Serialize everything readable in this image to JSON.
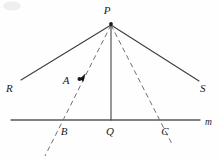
{
  "figure": {
    "labels": {
      "p": "P",
      "r": "R",
      "s": "S",
      "a": "A",
      "b": "B",
      "q": "Q",
      "c": "C",
      "m": "m"
    },
    "points": {
      "P": {
        "x": 111,
        "y": 23
      },
      "R": {
        "x": 21,
        "y": 80
      },
      "S": {
        "x": 199,
        "y": 81
      },
      "A": {
        "x": 79,
        "y": 79
      },
      "B": {
        "x": 62,
        "y": 120
      },
      "Q": {
        "x": 111,
        "y": 120
      },
      "C": {
        "x": 160,
        "y": 120
      }
    },
    "line_m": {
      "x1": 11,
      "y1": 120,
      "x2": 200,
      "y2": 120
    },
    "segments": [
      {
        "name": "P-R",
        "x1": 111,
        "y1": 25,
        "x2": 21,
        "y2": 80,
        "style": "solid"
      },
      {
        "name": "P-S",
        "x1": 111,
        "y1": 25,
        "x2": 199,
        "y2": 81,
        "style": "solid"
      },
      {
        "name": "P-Q",
        "x1": 111,
        "y1": 25,
        "x2": 111,
        "y2": 120,
        "style": "solid"
      },
      {
        "name": "P-B-extended",
        "x1": 111,
        "y1": 25,
        "x2": 45,
        "y2": 156,
        "style": "dashed"
      },
      {
        "name": "P-C-extended",
        "x1": 111,
        "y1": 25,
        "x2": 173,
        "y2": 146,
        "style": "dashed"
      }
    ],
    "colors": {
      "ink": "#3b3b42",
      "baseline": "#59595f",
      "dashed": "#6f6f76",
      "label": "#1b1b1b",
      "background": "#fefefe"
    },
    "markers": {
      "a_dot": {
        "x": 79,
        "y": 79,
        "r": 2.0
      },
      "p_dot": {
        "x": 111,
        "y": 24,
        "r": 1.8
      },
      "arrow_at_a": {
        "x": 79,
        "y": 79,
        "angle": 243
      }
    }
  }
}
